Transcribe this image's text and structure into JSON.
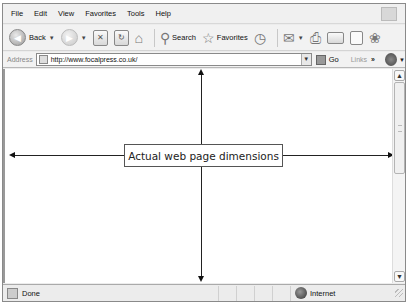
{
  "menubar": {
    "items": [
      "File",
      "Edit",
      "View",
      "Favorites",
      "Tools",
      "Help"
    ]
  },
  "toolbar": {
    "back_label": "Back",
    "search_label": "Search",
    "favorites_label": "Favorites",
    "icons": [
      "back-icon",
      "forward-icon",
      "stop-icon",
      "refresh-icon",
      "home-icon",
      "search-icon",
      "favorites-star-icon",
      "history-icon",
      "mail-icon",
      "print-icon",
      "edit-icon",
      "discuss-icon",
      "messenger-icon"
    ]
  },
  "addressbar": {
    "label": "Address",
    "url": "http://www.focalpress.co.uk/",
    "go_label": "Go",
    "links_label": "Links",
    "chevron": "»"
  },
  "content": {
    "annotation_label": "Actual web page dimensions"
  },
  "statusbar": {
    "status_text": "Done",
    "zone_text": "Internet"
  },
  "scrollbar": {
    "up": "▲",
    "down": "▼"
  }
}
